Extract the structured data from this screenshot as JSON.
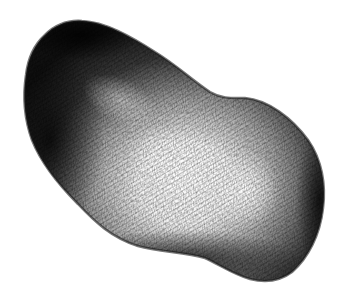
{
  "image": {
    "subject": "Hatched pen-and-ink illustration of a kidney-shaped potato",
    "background_color": "#ffffff",
    "ink_color": "#111111",
    "highlight_color": "#f8f8f8",
    "shape": {
      "outline_points": [
        [
          45,
          35
        ],
        [
          70,
          22
        ],
        [
          100,
          28
        ],
        [
          150,
          50
        ],
        [
          190,
          78
        ],
        [
          215,
          95
        ],
        [
          240,
          98
        ],
        [
          270,
          110
        ],
        [
          300,
          130
        ],
        [
          320,
          165
        ],
        [
          324,
          200
        ],
        [
          315,
          240
        ],
        [
          300,
          265
        ],
        [
          280,
          278
        ],
        [
          260,
          280
        ],
        [
          230,
          270
        ],
        [
          200,
          255
        ],
        [
          160,
          250
        ],
        [
          120,
          240
        ],
        [
          90,
          215
        ],
        [
          65,
          190
        ],
        [
          40,
          160
        ],
        [
          26,
          125
        ],
        [
          25,
          90
        ],
        [
          32,
          55
        ]
      ],
      "highlight_center": [
        190,
        170
      ],
      "secondary_highlight_center": [
        250,
        190
      ]
    }
  }
}
